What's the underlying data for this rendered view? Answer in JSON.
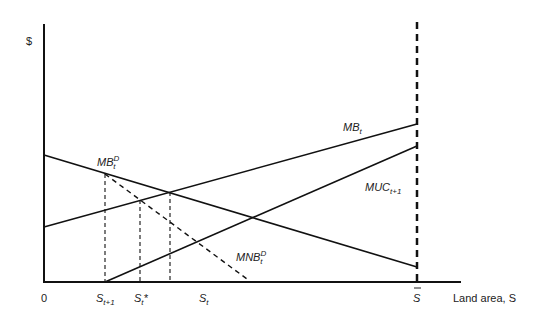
{
  "diagram": {
    "type": "economics-supply-demand",
    "y_axis_label": "$",
    "x_axis_label": "Land area, S",
    "origin_label": "0",
    "x_ticks": [
      {
        "base": "S",
        "sub": "t+1",
        "sup": ""
      },
      {
        "base": "S",
        "sub": "t",
        "sup": "",
        "suffix": "*"
      },
      {
        "base": "S",
        "sub": "t",
        "sup": ""
      },
      {
        "base": "S",
        "bar": true
      }
    ],
    "curves": [
      {
        "name": "MB",
        "sub": "t",
        "style": "solid",
        "label": "MB_t"
      },
      {
        "name": "MUC",
        "sub": "t+1",
        "style": "solid",
        "label": "MUC_t+1"
      },
      {
        "name": "MB",
        "sub": "t",
        "sup": "D",
        "style": "solid",
        "label": "MB_t^D"
      },
      {
        "name": "MNB",
        "sub": "t",
        "sup": "D",
        "style": "dashed",
        "label": "MNB_t^D"
      }
    ],
    "boundary": {
      "label": "S-bar",
      "style": "dashed"
    }
  },
  "labels": {
    "dollar": "$",
    "zero": "0",
    "land_area": "Land area, S",
    "mb": "MB",
    "mb_sub": "t",
    "muc": "MUC",
    "muc_sub": "t+1",
    "mbd": "MB",
    "mbd_sub": "t",
    "mbd_sup": "D",
    "mnb": "MNB",
    "mnb_sub": "t",
    "mnb_sup": "D",
    "s": "S",
    "s_t1_sub": "t+1",
    "s_star_sub": "t",
    "s_star_suffix": "*",
    "s_t_sub": "t",
    "sbar": "S"
  }
}
